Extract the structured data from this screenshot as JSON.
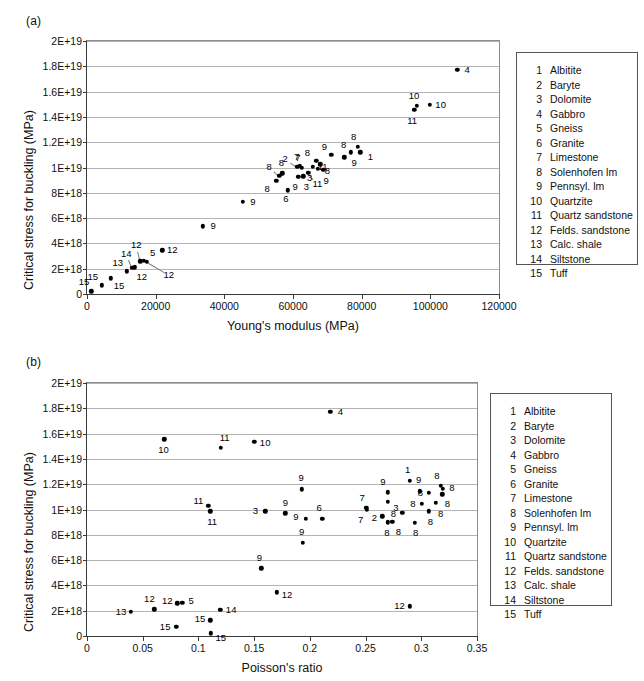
{
  "figure": {
    "panel_a_label": "(a)",
    "panel_b_label": "(b)"
  },
  "legend": {
    "entries": [
      {
        "num": "1",
        "name": "Albitite"
      },
      {
        "num": "2",
        "name": "Baryte"
      },
      {
        "num": "3",
        "name": "Dolomite"
      },
      {
        "num": "4",
        "name": "Gabbro"
      },
      {
        "num": "5",
        "name": "Gneiss"
      },
      {
        "num": "6",
        "name": "Granite"
      },
      {
        "num": "7",
        "name": "Limestone"
      },
      {
        "num": "8",
        "name": "Solenhofen lm"
      },
      {
        "num": "9",
        "name": "Pennsyl. lm"
      },
      {
        "num": "10",
        "name": "Quartzite"
      },
      {
        "num": "11",
        "name": "Quartz sandstone"
      },
      {
        "num": "12",
        "name": "Felds. sandstone"
      },
      {
        "num": "13",
        "name": "Calc. shale"
      },
      {
        "num": "14",
        "name": "Siltstone"
      },
      {
        "num": "15",
        "name": "Tuff"
      }
    ]
  },
  "chart_data": [
    {
      "id": "a",
      "type": "scatter",
      "title": "(a)",
      "xlabel": "Young's modulus (MPa)",
      "ylabel": "Critical stress for buckling (MPa)",
      "xlim": [
        0,
        120000
      ],
      "ylim": [
        0,
        2e+19
      ],
      "xticks": [
        0,
        20000,
        40000,
        60000,
        80000,
        100000,
        120000
      ],
      "xticklabels": [
        "0",
        "20000",
        "40000",
        "60000",
        "80000",
        "100000",
        "120000"
      ],
      "yticks": [
        0,
        2e+18,
        4e+18,
        6e+18,
        8e+18,
        1e+19,
        1.2e+19,
        1.4e+19,
        1.6e+19,
        1.8e+19,
        2e+19
      ],
      "yticklabels": [
        "0",
        "2E+18",
        "4E+18",
        "6E+18",
        "8E+18",
        "1E+19",
        "1.2E+19",
        "1.4E+19",
        "1.6E+19",
        "1.8E+19",
        "2E+19"
      ],
      "grid": true,
      "legend_position": "right-outside",
      "points": [
        {
          "label": "15",
          "x": 1200,
          "y": 2.2e+17,
          "lx": -7,
          "ly": -9
        },
        {
          "label": "15",
          "x": 4300,
          "y": 6.9e+17,
          "lx": -9,
          "ly": -8
        },
        {
          "label": "15",
          "x": 7000,
          "y": 1.25e+18,
          "lx": 8,
          "ly": 8
        },
        {
          "label": "13",
          "x": 11600,
          "y": 1.8e+18,
          "lx": -9,
          "ly": -8
        },
        {
          "label": "14",
          "x": 13200,
          "y": 2.05e+18,
          "lx": -6,
          "ly": -14
        },
        {
          "label": "12",
          "x": 13900,
          "y": 2.1e+18,
          "lx": 7,
          "ly": 10
        },
        {
          "label": "12",
          "x": 15500,
          "y": 2.6e+18,
          "lx": -4,
          "ly": -16
        },
        {
          "label": "5",
          "x": 16500,
          "y": 2.62e+18,
          "lx": 9,
          "ly": -8
        },
        {
          "label": "12",
          "x": 21900,
          "y": 3.45e+18,
          "lx": 10,
          "ly": 0
        },
        {
          "label": "12",
          "x": 17400,
          "y": 2.55e+18,
          "lx": 22,
          "ly": 13
        },
        {
          "label": "9",
          "x": 33800,
          "y": 5.35e+18,
          "lx": 10,
          "ly": 0
        },
        {
          "label": "9",
          "x": 45400,
          "y": 7.3e+18,
          "lx": 10,
          "ly": 0
        },
        {
          "label": "8",
          "x": 55100,
          "y": 8.95e+18,
          "lx": -9,
          "ly": 8
        },
        {
          "label": "8",
          "x": 56000,
          "y": 9.35e+18,
          "lx": -10,
          "ly": -9
        },
        {
          "label": "8",
          "x": 56900,
          "y": 9.55e+18,
          "lx": -1,
          "ly": -10
        },
        {
          "label": "2",
          "x": 61200,
          "y": 1.005e+19,
          "lx": -12,
          "ly": -8
        },
        {
          "label": "7",
          "x": 62000,
          "y": 1.015e+19,
          "lx": -3,
          "ly": -9
        },
        {
          "label": "7",
          "x": 62600,
          "y": 1e+19,
          "lx": -4,
          "ly": -10
        },
        {
          "label": "9",
          "x": 61500,
          "y": 9.25e+18,
          "lx": -3,
          "ly": 10
        },
        {
          "label": "3",
          "x": 63000,
          "y": 9.3e+18,
          "lx": 3,
          "ly": 11
        },
        {
          "label": "6",
          "x": 58500,
          "y": 8.2e+18,
          "lx": -2,
          "ly": 9
        },
        {
          "label": "11",
          "x": 65700,
          "y": 1.005e+19,
          "lx": 10,
          "ly": 0
        },
        {
          "label": "11",
          "x": 64500,
          "y": 9.6e+18,
          "lx": 9,
          "ly": 11
        },
        {
          "label": "8",
          "x": 66800,
          "y": 1.055e+19,
          "lx": -9,
          "ly": -8
        },
        {
          "label": "8",
          "x": 68000,
          "y": 1.025e+19,
          "lx": 7,
          "ly": 7
        },
        {
          "label": "3",
          "x": 67200,
          "y": 9.9e+18,
          "lx": -8,
          "ly": 9
        },
        {
          "label": "9",
          "x": 68800,
          "y": 9.8e+18,
          "lx": 3,
          "ly": 11
        },
        {
          "label": "9",
          "x": 71200,
          "y": 1.1e+19,
          "lx": -7,
          "ly": -8
        },
        {
          "label": "9",
          "x": 74900,
          "y": 1.08e+19,
          "lx": 10,
          "ly": 6
        },
        {
          "label": "8",
          "x": 76800,
          "y": 1.12e+19,
          "lx": -7,
          "ly": -7
        },
        {
          "label": "8",
          "x": 78800,
          "y": 1.165e+19,
          "lx": -4,
          "ly": -10
        },
        {
          "label": "1",
          "x": 79600,
          "y": 1.12e+19,
          "lx": 10,
          "ly": 5
        },
        {
          "label": "11",
          "x": 95300,
          "y": 1.455e+19,
          "lx": -2,
          "ly": 11
        },
        {
          "label": "10",
          "x": 96100,
          "y": 1.49e+19,
          "lx": -3,
          "ly": -10
        },
        {
          "label": "10",
          "x": 99800,
          "y": 1.495e+19,
          "lx": 11,
          "ly": 0
        },
        {
          "label": "4",
          "x": 107800,
          "y": 1.77e+19,
          "lx": 10,
          "ly": 0
        }
      ]
    },
    {
      "id": "b",
      "type": "scatter",
      "title": "(b)",
      "xlabel": "Poisson's ratio",
      "ylabel": "Critical stress for buckling (MPa)",
      "xlim": [
        0,
        0.35
      ],
      "ylim": [
        0,
        2e+19
      ],
      "xticks": [
        0,
        0.05,
        0.1,
        0.15,
        0.2,
        0.25,
        0.3,
        0.35
      ],
      "xticklabels": [
        "0",
        "0.05",
        "0.1",
        "0.15",
        "0.2",
        "0.25",
        "0.3",
        "0.35"
      ],
      "yticks": [
        0,
        2e+18,
        4e+18,
        6e+18,
        8e+18,
        1e+19,
        1.2e+19,
        1.4e+19,
        1.6e+19,
        1.8e+19,
        2e+19
      ],
      "yticklabels": [
        "0",
        "2E+18",
        "4E+18",
        "6E+18",
        "8E+18",
        "1E+19",
        "1.2E+19",
        "1.4E+19",
        "1.6E+19",
        "1.8E+19",
        "2E+19"
      ],
      "grid": true,
      "legend_position": "right-outside",
      "points": [
        {
          "label": "13",
          "x": 0.0395,
          "y": 1.92e+18,
          "lx": -10,
          "ly": 0
        },
        {
          "label": "12",
          "x": 0.0605,
          "y": 2.1e+18,
          "lx": -5,
          "ly": -10
        },
        {
          "label": "10",
          "x": 0.0695,
          "y": 1.555e+19,
          "lx": -1,
          "ly": 11
        },
        {
          "label": "15",
          "x": 0.08,
          "y": 7.5e+17,
          "lx": -11,
          "ly": 0
        },
        {
          "label": "12",
          "x": 0.081,
          "y": 2.6e+18,
          "lx": -10,
          "ly": -2
        },
        {
          "label": "5",
          "x": 0.0855,
          "y": 2.62e+18,
          "lx": 9,
          "ly": -2
        },
        {
          "label": "11",
          "x": 0.109,
          "y": 1.03e+19,
          "lx": -10,
          "ly": -5
        },
        {
          "label": "15",
          "x": 0.1105,
          "y": 1.25e+18,
          "lx": -10,
          "ly": -1
        },
        {
          "label": "15",
          "x": 0.111,
          "y": 2.2e+17,
          "lx": 10,
          "ly": 5
        },
        {
          "label": "11",
          "x": 0.1105,
          "y": 9.85e+18,
          "lx": 2,
          "ly": 11
        },
        {
          "label": "14",
          "x": 0.1195,
          "y": 2.08e+18,
          "lx": 11,
          "ly": 0
        },
        {
          "label": "11",
          "x": 0.12,
          "y": 1.49e+19,
          "lx": 4,
          "ly": -10
        },
        {
          "label": "10",
          "x": 0.15,
          "y": 1.535e+19,
          "lx": 11,
          "ly": 1
        },
        {
          "label": "9",
          "x": 0.1565,
          "y": 5.35e+18,
          "lx": -2,
          "ly": -10
        },
        {
          "label": "3",
          "x": 0.16,
          "y": 9.85e+18,
          "lx": -10,
          "ly": 0
        },
        {
          "label": "12",
          "x": 0.1705,
          "y": 3.45e+18,
          "lx": 10,
          "ly": 3
        },
        {
          "label": "9",
          "x": 0.178,
          "y": 9.7e+18,
          "lx": 0,
          "ly": -10
        },
        {
          "label": "9",
          "x": 0.193,
          "y": 1.16e+19,
          "lx": -1,
          "ly": -11
        },
        {
          "label": "9",
          "x": 0.1935,
          "y": 7.35e+18,
          "lx": -1,
          "ly": -11
        },
        {
          "label": "6",
          "x": 0.211,
          "y": 9.25e+18,
          "lx": -3,
          "ly": -11
        },
        {
          "label": "9",
          "x": 0.1965,
          "y": 9.25e+18,
          "lx": -10,
          "ly": -2
        },
        {
          "label": "4",
          "x": 0.2185,
          "y": 1.77e+19,
          "lx": 10,
          "ly": 0
        },
        {
          "label": "7",
          "x": 0.2505,
          "y": 1.015e+19,
          "lx": -4,
          "ly": -10
        },
        {
          "label": "7",
          "x": 0.251,
          "y": 1e+19,
          "lx": -6,
          "ly": 10
        },
        {
          "label": "2",
          "x": 0.265,
          "y": 9.45e+18,
          "lx": -8,
          "ly": 2
        },
        {
          "label": "9",
          "x": 0.27,
          "y": 1.135e+19,
          "lx": -5,
          "ly": -10
        },
        {
          "label": "3",
          "x": 0.27,
          "y": 1.06e+19,
          "lx": 8,
          "ly": 6
        },
        {
          "label": "8",
          "x": 0.27,
          "y": 9e+18,
          "lx": -1,
          "ly": 11
        },
        {
          "label": "8",
          "x": 0.274,
          "y": 9.05e+18,
          "lx": 6,
          "ly": 10
        },
        {
          "label": "1",
          "x": 0.2895,
          "y": 1.225e+19,
          "lx": -2,
          "ly": -11
        },
        {
          "label": "8",
          "x": 0.283,
          "y": 9.75e+18,
          "lx": -9,
          "ly": 1
        },
        {
          "label": "12",
          "x": 0.2895,
          "y": 2.35e+18,
          "lx": -10,
          "ly": 0
        },
        {
          "label": "9",
          "x": 0.2985,
          "y": 1.145e+19,
          "lx": -1,
          "ly": -11
        },
        {
          "label": "8",
          "x": 0.3005,
          "y": 1.045e+19,
          "lx": -9,
          "ly": 0
        },
        {
          "label": "8",
          "x": 0.294,
          "y": 8.95e+18,
          "lx": 1,
          "ly": 10
        },
        {
          "label": "8",
          "x": 0.3065,
          "y": 1.13e+19,
          "lx": -8,
          "ly": 0
        },
        {
          "label": "8",
          "x": 0.3065,
          "y": 9.85e+18,
          "lx": 2,
          "ly": 11
        },
        {
          "label": "8",
          "x": 0.3175,
          "y": 1.185e+19,
          "lx": -4,
          "ly": -10
        },
        {
          "label": "8",
          "x": 0.3195,
          "y": 1.165e+19,
          "lx": 9,
          "ly": -1
        },
        {
          "label": "8",
          "x": 0.319,
          "y": 1.12e+19,
          "lx": 5,
          "ly": 10
        },
        {
          "label": "8",
          "x": 0.313,
          "y": 1.055e+19,
          "lx": 5,
          "ly": 11
        }
      ]
    }
  ]
}
